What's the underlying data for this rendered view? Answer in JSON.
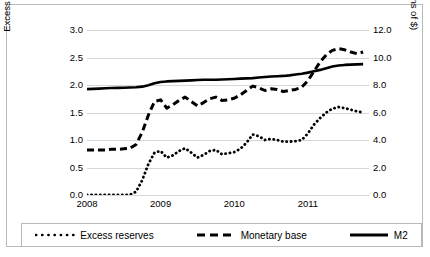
{
  "chart_data": {
    "type": "line",
    "title": "",
    "xlabel": "",
    "ylabel": "Excess reserves and monetary base (trillions of $)",
    "y2label": "M2 (trillions of $)",
    "ylim": [
      0.0,
      3.0
    ],
    "y2lim": [
      0.0,
      12.0
    ],
    "yticks": [
      "0.0",
      "0.5",
      "1.0",
      "1.5",
      "2.0",
      "2.5",
      "3.0"
    ],
    "y2ticks": [
      "0.0",
      "2.0",
      "4.0",
      "6.0",
      "8.0",
      "10.0",
      "12.0"
    ],
    "xticks": [
      "2008",
      "2009",
      "2010",
      "2011"
    ],
    "xlim": [
      2008.0,
      2011.83
    ],
    "grid": true,
    "legend_position": "bottom",
    "x": [
      2008.0,
      2008.083,
      2008.167,
      2008.25,
      2008.333,
      2008.417,
      2008.5,
      2008.583,
      2008.667,
      2008.75,
      2008.833,
      2008.917,
      2009.0,
      2009.083,
      2009.167,
      2009.25,
      2009.333,
      2009.417,
      2009.5,
      2009.583,
      2009.667,
      2009.75,
      2009.833,
      2009.917,
      2010.0,
      2010.083,
      2010.167,
      2010.25,
      2010.333,
      2010.417,
      2010.5,
      2010.583,
      2010.667,
      2010.75,
      2010.833,
      2010.917,
      2011.0,
      2011.083,
      2011.167,
      2011.25,
      2011.333,
      2011.417,
      2011.5,
      2011.583,
      2011.667,
      2011.75
    ],
    "series": [
      {
        "name": "Excess reserves",
        "axis": "left",
        "style": "dotted",
        "units": "trillions of $",
        "values": [
          0.002,
          0.003,
          0.003,
          0.003,
          0.003,
          0.003,
          0.003,
          0.004,
          0.06,
          0.27,
          0.56,
          0.77,
          0.8,
          0.68,
          0.72,
          0.8,
          0.85,
          0.77,
          0.68,
          0.73,
          0.8,
          0.82,
          0.74,
          0.76,
          0.78,
          0.84,
          0.95,
          1.1,
          1.07,
          1.0,
          1.02,
          1.0,
          0.97,
          0.97,
          0.98,
          1.0,
          1.12,
          1.28,
          1.4,
          1.5,
          1.57,
          1.6,
          1.58,
          1.55,
          1.52,
          1.5
        ]
      },
      {
        "name": "Monetary base",
        "axis": "left",
        "style": "dashed",
        "units": "trillions of $",
        "values": [
          0.82,
          0.82,
          0.82,
          0.82,
          0.83,
          0.83,
          0.84,
          0.85,
          0.92,
          1.14,
          1.45,
          1.7,
          1.73,
          1.58,
          1.64,
          1.72,
          1.78,
          1.7,
          1.62,
          1.68,
          1.75,
          1.78,
          1.72,
          1.73,
          1.76,
          1.82,
          1.9,
          1.98,
          1.95,
          1.9,
          1.93,
          1.92,
          1.88,
          1.9,
          1.92,
          1.96,
          2.08,
          2.25,
          2.42,
          2.55,
          2.63,
          2.66,
          2.64,
          2.6,
          2.57,
          2.6
        ]
      },
      {
        "name": "M2",
        "axis": "right",
        "style": "solid",
        "units": "trillions of $",
        "values": [
          7.7,
          7.72,
          7.74,
          7.76,
          7.78,
          7.79,
          7.8,
          7.82,
          7.84,
          7.88,
          7.98,
          8.12,
          8.22,
          8.26,
          8.28,
          8.3,
          8.32,
          8.34,
          8.36,
          8.38,
          8.38,
          8.38,
          8.4,
          8.42,
          8.44,
          8.46,
          8.48,
          8.5,
          8.54,
          8.58,
          8.62,
          8.64,
          8.66,
          8.7,
          8.76,
          8.82,
          8.9,
          9.0,
          9.1,
          9.22,
          9.34,
          9.42,
          9.46,
          9.48,
          9.5,
          9.52
        ]
      }
    ]
  },
  "legend": {
    "items": [
      {
        "label": "Excess reserves",
        "style": "dotted"
      },
      {
        "label": "Monetary base",
        "style": "dashed"
      },
      {
        "label": "M2",
        "style": "solid"
      }
    ]
  },
  "colors": {
    "series": "#000000",
    "grid": "#d6d6d6",
    "border": "#b9b9b9",
    "background": "#ffffff"
  }
}
